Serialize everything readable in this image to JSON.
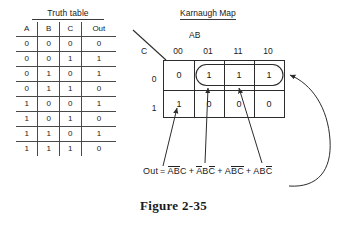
{
  "figure": {
    "caption": "Figure 2-35"
  },
  "truth_table": {
    "title": "Truth table",
    "headers": [
      "A",
      "B",
      "C",
      "Out"
    ],
    "rows": [
      [
        "0",
        "0",
        "0",
        "0"
      ],
      [
        "0",
        "0",
        "1",
        "1"
      ],
      [
        "0",
        "1",
        "0",
        "1"
      ],
      [
        "0",
        "1",
        "1",
        "0"
      ],
      [
        "1",
        "0",
        "0",
        "1"
      ],
      [
        "1",
        "0",
        "1",
        "0"
      ],
      [
        "1",
        "1",
        "0",
        "1"
      ],
      [
        "1",
        "1",
        "1",
        "0"
      ]
    ]
  },
  "karnaugh_map": {
    "title": "Karnaugh Map",
    "col_var_label": "AB",
    "row_var_label": "C",
    "col_headers": [
      "00",
      "01",
      "11",
      "10"
    ],
    "row_headers": [
      "0",
      "1"
    ],
    "cells": [
      [
        "0",
        "1",
        "1",
        "1"
      ],
      [
        "1",
        "0",
        "0",
        "0"
      ]
    ],
    "groups": [
      {
        "name": "top-row-ones-oval",
        "row": 0,
        "cols": [
          1,
          2,
          3
        ]
      }
    ]
  },
  "equation": {
    "lhs": "Out",
    "equals": "=",
    "terms": [
      {
        "bar_group": "AB",
        "plain_tail": "C"
      },
      {
        "a": "A",
        "a_bar": true,
        "b": "B",
        "b_bar": false,
        "c": "C",
        "c_bar": true
      },
      {
        "a": "A",
        "a_bar": false,
        "b": "B",
        "b_bar": true,
        "c": "C",
        "c_bar": true
      },
      {
        "a": "A",
        "a_bar": false,
        "b": "B",
        "b_bar": false,
        "c": "C",
        "c_bar": true
      }
    ],
    "text_terms": [
      "ABC",
      "ABC",
      "ABC",
      "ABC"
    ],
    "operators": [
      "+",
      "+",
      "+"
    ],
    "full_text": "Out = ABC + ABC + ABC + ABC"
  },
  "colors": {
    "ink": "#1a1a1a",
    "rule": "#4a4a4a",
    "grid": "#2c2c2c",
    "background": "#ffffff"
  }
}
